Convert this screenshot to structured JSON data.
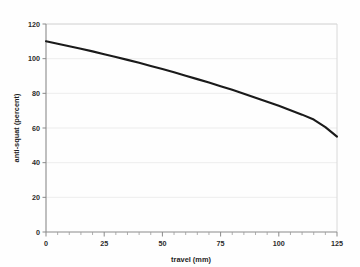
{
  "chart_data": {
    "type": "line",
    "title": "",
    "xlabel": "travel (mm)",
    "ylabel": "anti-squat (percent)",
    "xlim": [
      0,
      125
    ],
    "ylim": [
      0,
      120
    ],
    "grid": true,
    "legend": "none",
    "x_ticks": [
      0,
      25,
      50,
      75,
      100,
      125
    ],
    "x_tick_labels": [
      "0",
      "25",
      "50",
      "75",
      "100",
      "125"
    ],
    "x_minor_tick_step": 5,
    "y_ticks": [
      0,
      20,
      40,
      60,
      80,
      100,
      120
    ],
    "y_tick_labels": [
      "0",
      "20",
      "40",
      "60",
      "80",
      "100",
      "120"
    ],
    "line_color": "#1a1a1a",
    "grid_color": "#e9e9e9",
    "series": [
      {
        "name": "anti-squat",
        "x": [
          0,
          5,
          10,
          15,
          20,
          25,
          30,
          35,
          40,
          45,
          50,
          55,
          60,
          65,
          70,
          75,
          80,
          85,
          90,
          95,
          100,
          105,
          110,
          115,
          120,
          125
        ],
        "values": [
          110.0,
          108.6,
          107.2,
          105.7,
          104.2,
          102.6,
          101.0,
          99.3,
          97.6,
          95.8,
          94.0,
          92.1,
          90.2,
          88.2,
          86.2,
          84.1,
          82.0,
          79.8,
          77.5,
          75.2,
          72.8,
          70.3,
          67.7,
          64.9,
          60.5,
          55.0
        ]
      }
    ]
  },
  "axis_titles": {
    "x": "travel (mm)",
    "y": "anti-squat (percent)"
  }
}
